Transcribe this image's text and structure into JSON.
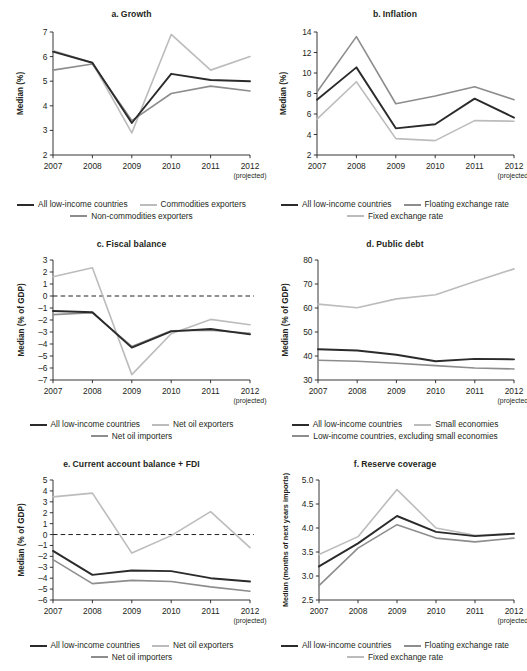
{
  "colors": {
    "all": "#2b2b2b",
    "mid": "#8d8d8d",
    "light": "#bcbcbc",
    "axis": "#231f20",
    "background": "#ffffff"
  },
  "x_categories": [
    "2007",
    "2008",
    "2009",
    "2010",
    "2011",
    "2012"
  ],
  "projected_note": "(projected)",
  "chart_data": [
    {
      "id": "a",
      "type": "line",
      "title": "a.  Growth",
      "title_letter": "a.",
      "title_text": "Growth",
      "xlabel": "",
      "ylabel": "Median (%)",
      "categories": [
        "2007",
        "2008",
        "2009",
        "2010",
        "2011",
        "2012"
      ],
      "ylim": [
        2,
        7
      ],
      "yticks": [
        2,
        3,
        4,
        5,
        6,
        7
      ],
      "ytick_labels": [
        "2",
        "3",
        "4",
        "5",
        "6",
        "7"
      ],
      "grid": false,
      "zero_line": false,
      "legend_position": "bottom",
      "series": [
        {
          "name": "All low-income countries",
          "color": "all",
          "width": 1.9,
          "values": [
            6.2,
            5.75,
            3.3,
            5.3,
            5.05,
            5.0
          ]
        },
        {
          "name": "Commodities exporters",
          "color": "light",
          "width": 1.6,
          "values": [
            6.25,
            5.75,
            2.9,
            6.9,
            5.45,
            6.0
          ]
        },
        {
          "name": "Non-commodities exporters",
          "color": "mid",
          "width": 1.6,
          "values": [
            5.45,
            5.7,
            3.4,
            4.5,
            4.8,
            4.6
          ]
        }
      ]
    },
    {
      "id": "b",
      "type": "line",
      "title": "b.  Inflation",
      "title_letter": "b.",
      "title_text": "Inflation",
      "xlabel": "",
      "ylabel": "Median (%)",
      "categories": [
        "2007",
        "2008",
        "2009",
        "2010",
        "2011",
        "2012"
      ],
      "ylim": [
        2,
        14
      ],
      "yticks": [
        2,
        4,
        6,
        8,
        10,
        12,
        14
      ],
      "ytick_labels": [
        "2",
        "4",
        "6",
        "8",
        "10",
        "12",
        "14"
      ],
      "grid": false,
      "zero_line": false,
      "legend_position": "bottom",
      "series": [
        {
          "name": "All low-income countries",
          "color": "all",
          "width": 1.9,
          "values": [
            7.4,
            10.55,
            4.6,
            5.0,
            7.5,
            5.65
          ]
        },
        {
          "name": "Floating exchange rate",
          "color": "mid",
          "width": 1.6,
          "values": [
            8.15,
            13.55,
            7.0,
            7.75,
            8.65,
            7.4
          ]
        },
        {
          "name": "Fixed exchange rate",
          "color": "light",
          "width": 1.6,
          "values": [
            5.5,
            9.15,
            3.6,
            3.4,
            5.35,
            5.3
          ]
        }
      ]
    },
    {
      "id": "c",
      "type": "line",
      "title": "c.  Fiscal balance",
      "title_letter": "c.",
      "title_text": "Fiscal balance",
      "xlabel": "",
      "ylabel": "Median (% of GDP)",
      "categories": [
        "2007",
        "2008",
        "2009",
        "2010",
        "2011",
        "2012"
      ],
      "ylim": [
        -7,
        3
      ],
      "yticks": [
        -7,
        -6,
        -5,
        -4,
        -3,
        -2,
        -1,
        0,
        1,
        2,
        3
      ],
      "ytick_labels": [
        "–7",
        "–6",
        "–5",
        "–4",
        "–3",
        "–2",
        "–1",
        "0",
        "1",
        "2",
        "3"
      ],
      "grid": false,
      "zero_line": true,
      "legend_position": "bottom",
      "series": [
        {
          "name": "All low-income countries",
          "color": "all",
          "width": 1.9,
          "values": [
            -1.25,
            -1.35,
            -4.3,
            -2.95,
            -2.75,
            -3.2
          ]
        },
        {
          "name": "Net oil exporters",
          "color": "light",
          "width": 1.6,
          "values": [
            1.6,
            2.35,
            -6.55,
            -3.15,
            -1.95,
            -2.4
          ]
        },
        {
          "name": "Net oil importers",
          "color": "mid",
          "width": 1.6,
          "values": [
            -1.55,
            -1.4,
            -4.2,
            -2.9,
            -2.85,
            -3.1
          ]
        }
      ]
    },
    {
      "id": "d",
      "type": "line",
      "title": "d.  Public debt",
      "title_letter": "d.",
      "title_text": "Public debt",
      "xlabel": "",
      "ylabel": "Median (% of GDP)",
      "categories": [
        "2007",
        "2008",
        "2009",
        "2010",
        "2011",
        "2012"
      ],
      "ylim": [
        30,
        80
      ],
      "yticks": [
        30,
        40,
        50,
        60,
        70,
        80
      ],
      "ytick_labels": [
        "30",
        "40",
        "50",
        "60",
        "70",
        "80"
      ],
      "grid": false,
      "zero_line": false,
      "legend_position": "bottom",
      "series": [
        {
          "name": "All low-income countries",
          "color": "all",
          "width": 1.9,
          "values": [
            42.8,
            42.3,
            40.5,
            37.8,
            38.8,
            38.6
          ]
        },
        {
          "name": "Small economies",
          "color": "light",
          "width": 1.6,
          "values": [
            61.6,
            60.1,
            63.8,
            65.5,
            71.0,
            76.3
          ]
        },
        {
          "name": "Low-income countries, excluding small economies",
          "color": "mid",
          "width": 1.6,
          "values": [
            38.2,
            37.8,
            37.0,
            36.0,
            35.0,
            34.6
          ]
        }
      ]
    },
    {
      "id": "e",
      "type": "line",
      "title": "e.  Current account balance + FDI",
      "title_letter": "e.",
      "title_text": "Current account balance + FDI",
      "xlabel": "",
      "ylabel": "Median (% of GDP)",
      "categories": [
        "2007",
        "2008",
        "2009",
        "2010",
        "2011",
        "2012"
      ],
      "ylim": [
        -6,
        5
      ],
      "yticks": [
        -6,
        -5,
        -4,
        -3,
        -2,
        -1,
        0,
        1,
        2,
        3,
        4,
        5
      ],
      "ytick_labels": [
        "–6",
        "–5",
        "–4",
        "–3",
        "–2",
        "–1",
        "0",
        "1",
        "2",
        "3",
        "4",
        "5"
      ],
      "grid": false,
      "zero_line": true,
      "legend_position": "bottom",
      "series": [
        {
          "name": "All low-income countries",
          "color": "all",
          "width": 1.9,
          "values": [
            -1.5,
            -3.7,
            -3.3,
            -3.35,
            -4.0,
            -4.3
          ]
        },
        {
          "name": "Net oil exporters",
          "color": "light",
          "width": 1.6,
          "values": [
            3.45,
            3.8,
            -1.7,
            -0.1,
            2.1,
            -1.2
          ]
        },
        {
          "name": "Net oil importers",
          "color": "mid",
          "width": 1.6,
          "values": [
            -2.3,
            -4.5,
            -4.2,
            -4.3,
            -4.8,
            -5.2
          ]
        }
      ]
    },
    {
      "id": "f",
      "type": "line",
      "title": "f.  Reserve coverage",
      "title_letter": "f.",
      "title_text": "Reserve coverage",
      "xlabel": "",
      "ylabel": "Median (months of next years imports)",
      "categories": [
        "2007",
        "2008",
        "2009",
        "2010",
        "2011",
        "2012"
      ],
      "ylim": [
        2.5,
        5.0
      ],
      "yticks": [
        2.5,
        3.0,
        3.5,
        4.0,
        4.5,
        5.0
      ],
      "ytick_labels": [
        "2.5",
        "3.0",
        "3.5",
        "4.0",
        "4.5",
        "5.0"
      ],
      "grid": false,
      "zero_line": false,
      "legend_position": "bottom",
      "series": [
        {
          "name": "All low-income countries",
          "color": "all",
          "width": 1.9,
          "values": [
            3.2,
            3.68,
            4.25,
            3.92,
            3.83,
            3.88
          ]
        },
        {
          "name": "Floating exchange rate",
          "color": "light",
          "width": 1.6,
          "values": [
            3.45,
            3.82,
            4.8,
            4.0,
            3.85,
            3.88
          ]
        },
        {
          "name": "Fixed exchange rate",
          "color": "mid",
          "width": 1.6,
          "values": [
            2.8,
            3.58,
            4.07,
            3.79,
            3.71,
            3.79
          ]
        }
      ]
    }
  ]
}
